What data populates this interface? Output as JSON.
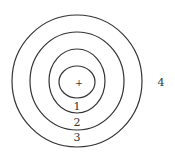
{
  "diagram": {
    "center_marker": "+",
    "rings": [
      {
        "label": "1"
      },
      {
        "label": "2"
      },
      {
        "label": "3"
      }
    ],
    "outside_label": "4",
    "stroke_color": "#333333"
  }
}
